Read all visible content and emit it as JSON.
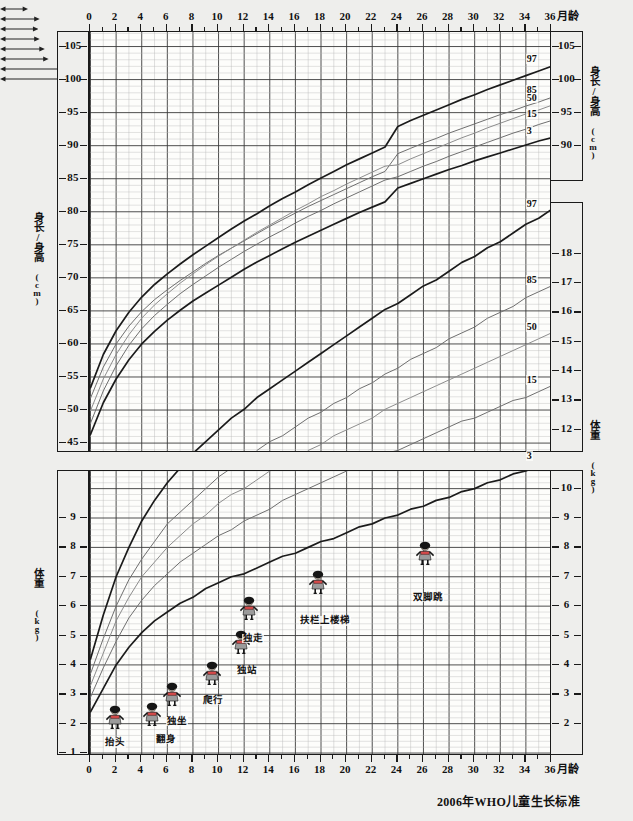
{
  "title": "2006年WHO儿童生长标准",
  "footer": "2006年WHO儿童生长标准",
  "axis": {
    "x_unit": "月龄",
    "x_ticks": [
      0,
      2,
      4,
      6,
      8,
      10,
      12,
      14,
      16,
      18,
      20,
      22,
      24,
      26,
      28,
      30,
      32,
      34,
      36
    ],
    "x_min": 0,
    "x_max": 36,
    "height_title": "身长/身高(cm)",
    "height_title_left": "身长/身高",
    "height_title_left_unit": "(cm)",
    "weight_title": "体重(kg)",
    "weight_title_left": "体重",
    "weight_title_left_unit": "(kg)",
    "height_ticks_left": [
      45,
      50,
      55,
      60,
      65,
      70,
      75,
      80,
      85,
      90,
      95,
      100,
      105
    ],
    "height_ticks_right": [
      90,
      95,
      100,
      105
    ],
    "weight_ticks_right_upper": [
      9,
      10,
      11,
      12,
      13,
      14,
      15,
      16,
      17,
      18
    ],
    "weight_ticks_left_lower": [
      1,
      2,
      3,
      4,
      5,
      6,
      7,
      8,
      9
    ],
    "weight_ticks_right_lower": [
      2,
      3,
      4,
      5,
      6,
      7,
      8,
      9,
      10
    ]
  },
  "percentile_labels": [
    "97",
    "85",
    "50",
    "15",
    "3"
  ],
  "milestones": [
    {
      "name": "抬头",
      "fig_month": 2.0,
      "fig_kg": 1.85,
      "label_month": 2.0,
      "label_kg": 1.3,
      "bar_from": 1.0,
      "bar_to": 3.2,
      "bar_kg": 1.52
    },
    {
      "name": "翻身",
      "fig_month": 4.9,
      "fig_kg": 1.95,
      "label_month": 6.0,
      "label_kg": 1.42,
      "bar_from": 4.5,
      "bar_to": 7.6,
      "bar_kg": 1.66
    },
    {
      "name": "独坐",
      "fig_month": 6.5,
      "fig_kg": 2.65,
      "label_month": 6.9,
      "label_kg": 2.04,
      "bar_from": 5.3,
      "bar_to": 8.3,
      "bar_kg": 2.28
    },
    {
      "name": "爬行",
      "fig_month": 9.6,
      "fig_kg": 3.35,
      "label_month": 9.7,
      "label_kg": 2.75,
      "bar_from": 8.2,
      "bar_to": 11.3,
      "bar_kg": 3.0
    },
    {
      "name": "独站",
      "fig_month": 11.9,
      "fig_kg": 4.4,
      "label_month": 12.3,
      "label_kg": 3.75,
      "bar_from": 10.4,
      "bar_to": 13.9,
      "bar_kg": 4.0
    },
    {
      "name": "独走",
      "fig_month": 12.5,
      "fig_kg": 5.55,
      "label_month": 12.8,
      "label_kg": 4.85,
      "bar_from": 11.2,
      "bar_to": 15.0,
      "bar_kg": 5.05
    },
    {
      "name": "扶栏上楼梯",
      "fig_month": 17.9,
      "fig_kg": 6.45,
      "label_month": 18.4,
      "label_kg": 5.45,
      "bar_from": 14.5,
      "bar_to": 22.0,
      "bar_kg": 5.77
    },
    {
      "name": "双脚跳",
      "fig_month": 26.2,
      "fig_kg": 7.45,
      "label_month": 26.5,
      "label_kg": 6.25,
      "bar_from": 21.8,
      "bar_to": 32.2,
      "bar_kg": 6.62
    }
  ],
  "chart_data": [
    {
      "type": "line",
      "title": "身长/身高(cm) - 2006年WHO儿童生长标准",
      "xlabel": "月龄",
      "ylabel": "身长/身高(cm)",
      "xlim": [
        0,
        36
      ],
      "ylim": [
        44,
        107
      ],
      "grid": true,
      "legend": "curve-end labels (percentiles)",
      "x": [
        0,
        1,
        2,
        3,
        4,
        5,
        6,
        7,
        8,
        9,
        10,
        11,
        12,
        13,
        14,
        15,
        16,
        17,
        18,
        19,
        20,
        21,
        22,
        23,
        24,
        25,
        26,
        27,
        28,
        29,
        30,
        31,
        32,
        33,
        34,
        35,
        36
      ],
      "series": [
        {
          "name": "97",
          "values": [
            53.4,
            58.4,
            62.0,
            64.8,
            67.1,
            69.0,
            70.6,
            72.1,
            73.5,
            74.8,
            76.1,
            77.4,
            78.6,
            79.7,
            80.9,
            82.0,
            83.0,
            84.1,
            85.1,
            86.1,
            87.1,
            88.0,
            88.9,
            89.8,
            92.9,
            93.8,
            94.6,
            95.4,
            96.2,
            97.0,
            97.7,
            98.5,
            99.2,
            99.9,
            100.6,
            101.3,
            102.0
          ]
        },
        {
          "name": "85",
          "values": [
            51.8,
            56.5,
            60.0,
            62.7,
            64.9,
            66.7,
            68.2,
            69.6,
            70.9,
            72.2,
            73.4,
            74.5,
            75.6,
            76.7,
            77.8,
            78.8,
            79.8,
            80.8,
            81.7,
            82.6,
            83.5,
            84.4,
            85.3,
            86.1,
            88.8,
            89.6,
            90.4,
            91.1,
            91.9,
            92.6,
            93.3,
            94.0,
            94.7,
            95.3,
            96.0,
            96.6,
            97.3
          ]
        },
        {
          "name": "50",
          "values": [
            49.9,
            54.7,
            58.4,
            61.4,
            63.9,
            65.9,
            67.6,
            69.2,
            70.6,
            72.0,
            73.3,
            74.5,
            75.7,
            76.9,
            78.0,
            79.1,
            80.2,
            81.2,
            82.3,
            83.2,
            84.2,
            85.1,
            86.0,
            86.9,
            87.1,
            88.0,
            88.8,
            89.6,
            90.4,
            91.2,
            91.9,
            92.7,
            93.4,
            94.1,
            94.8,
            95.4,
            96.1
          ]
        },
        {
          "name": "15",
          "values": [
            48.0,
            52.9,
            56.7,
            59.8,
            62.3,
            64.3,
            66.0,
            67.6,
            69.0,
            70.3,
            71.6,
            72.8,
            74.0,
            75.1,
            76.2,
            77.2,
            78.3,
            79.3,
            80.2,
            81.2,
            82.1,
            83.0,
            83.9,
            84.8,
            85.3,
            86.1,
            86.9,
            87.6,
            88.4,
            89.1,
            89.8,
            90.5,
            91.2,
            91.9,
            92.5,
            93.2,
            93.8
          ]
        },
        {
          "name": "3",
          "values": [
            46.3,
            51.1,
            54.7,
            57.6,
            60.0,
            61.9,
            63.6,
            65.1,
            66.5,
            67.7,
            68.9,
            70.1,
            71.3,
            72.4,
            73.4,
            74.4,
            75.4,
            76.3,
            77.2,
            78.1,
            79.0,
            79.9,
            80.7,
            81.5,
            83.6,
            84.3,
            85.0,
            85.7,
            86.4,
            87.0,
            87.7,
            88.3,
            88.9,
            89.5,
            90.1,
            90.7,
            91.2
          ]
        }
      ],
      "series_labels_at_x36": {
        "97": "97",
        "85": "85",
        "50": "50",
        "15": "15",
        "3": "3"
      }
    },
    {
      "type": "line",
      "title": "体重(kg) - 2006年WHO儿童生长标准",
      "xlabel": "月龄",
      "ylabel": "体重(kg)",
      "xlim": [
        0,
        36
      ],
      "ylim": [
        1,
        18.5
      ],
      "grid": true,
      "legend": "curve-end labels (percentiles)",
      "x": [
        0,
        1,
        2,
        3,
        4,
        5,
        6,
        7,
        8,
        9,
        10,
        11,
        12,
        13,
        14,
        15,
        16,
        17,
        18,
        19,
        20,
        21,
        22,
        23,
        24,
        25,
        26,
        27,
        28,
        29,
        30,
        31,
        32,
        33,
        34,
        35,
        36
      ],
      "series": [
        {
          "name": "97",
          "values": [
            4.2,
            5.7,
            7.0,
            8.0,
            8.9,
            9.6,
            10.2,
            10.7,
            11.2,
            11.6,
            12.0,
            12.4,
            12.7,
            13.1,
            13.4,
            13.7,
            14.0,
            14.3,
            14.6,
            14.9,
            15.2,
            15.5,
            15.8,
            16.1,
            16.3,
            16.6,
            16.9,
            17.1,
            17.4,
            17.7,
            17.9,
            18.2,
            18.4,
            18.7,
            19.0,
            19.2,
            19.5
          ]
        },
        {
          "name": "85",
          "values": [
            3.7,
            4.9,
            6.0,
            6.9,
            7.6,
            8.2,
            8.8,
            9.2,
            9.6,
            10.0,
            10.4,
            10.7,
            11.0,
            11.3,
            11.6,
            11.8,
            12.1,
            12.4,
            12.6,
            12.9,
            13.1,
            13.4,
            13.6,
            13.9,
            14.1,
            14.4,
            14.6,
            14.8,
            15.1,
            15.3,
            15.5,
            15.8,
            16.0,
            16.2,
            16.5,
            16.7,
            16.9
          ]
        },
        {
          "name": "50",
          "values": [
            3.3,
            4.4,
            5.5,
            6.3,
            7.0,
            7.5,
            8.0,
            8.4,
            8.8,
            9.1,
            9.5,
            9.8,
            10.0,
            10.3,
            10.6,
            10.8,
            11.1,
            11.3,
            11.5,
            11.8,
            12.0,
            12.2,
            12.4,
            12.7,
            12.9,
            13.1,
            13.3,
            13.5,
            13.7,
            13.9,
            14.1,
            14.3,
            14.5,
            14.7,
            14.9,
            15.1,
            15.3
          ]
        },
        {
          "name": "15",
          "values": [
            2.9,
            3.9,
            4.8,
            5.6,
            6.2,
            6.7,
            7.1,
            7.5,
            7.8,
            8.1,
            8.4,
            8.6,
            8.9,
            9.1,
            9.3,
            9.6,
            9.8,
            10.0,
            10.2,
            10.4,
            10.6,
            10.8,
            11.0,
            11.2,
            11.3,
            11.5,
            11.7,
            11.9,
            12.1,
            12.3,
            12.4,
            12.6,
            12.8,
            13.0,
            13.1,
            13.3,
            13.5
          ]
        },
        {
          "name": "3",
          "values": [
            2.4,
            3.2,
            4.0,
            4.6,
            5.1,
            5.5,
            5.8,
            6.1,
            6.3,
            6.6,
            6.8,
            7.0,
            7.1,
            7.3,
            7.5,
            7.7,
            7.8,
            8.0,
            8.2,
            8.3,
            8.5,
            8.7,
            8.8,
            9.0,
            9.1,
            9.3,
            9.4,
            9.6,
            9.7,
            9.9,
            10.0,
            10.2,
            10.3,
            10.5,
            10.6,
            10.8,
            10.9
          ]
        }
      ],
      "series_labels_at_x36": {
        "97": "97",
        "85": "85",
        "50": "50",
        "15": "15",
        "3": "3"
      }
    }
  ]
}
